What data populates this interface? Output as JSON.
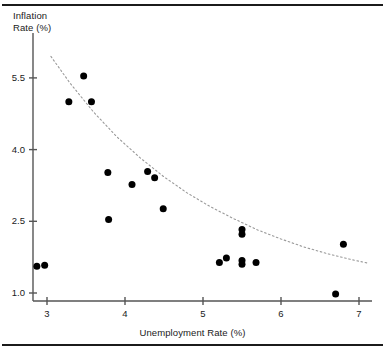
{
  "figure": {
    "ylabel_line1": "Inflation",
    "ylabel_line2": "Rate (%)",
    "xlabel": "Unemployment Rate (%)",
    "rule_color": "#1b1b1b",
    "axis_color": "#555555",
    "point_color": "#000000",
    "trend_color": "#9a9a9a"
  },
  "chart_data": {
    "type": "scatter",
    "title": "",
    "xlabel": "Unemployment Rate (%)",
    "ylabel": "Inflation Rate (%)",
    "xlim": [
      2.62,
      7.3
    ],
    "ylim": [
      0.83,
      6.1
    ],
    "xticks": [
      3,
      4,
      5,
      6,
      7
    ],
    "xtick_labels": [
      "3",
      "4",
      "5",
      "6",
      "7"
    ],
    "yticks": [
      1.0,
      2.5,
      4.0,
      5.5
    ],
    "ytick_labels": [
      "1.0",
      "2.5",
      "4.0",
      "5.5"
    ],
    "grid": false,
    "legend": null,
    "points": [
      {
        "x": 2.87,
        "y": 1.56
      },
      {
        "x": 2.97,
        "y": 1.58
      },
      {
        "x": 3.28,
        "y": 5.0
      },
      {
        "x": 3.47,
        "y": 5.54
      },
      {
        "x": 3.57,
        "y": 5.0
      },
      {
        "x": 3.78,
        "y": 3.52
      },
      {
        "x": 3.79,
        "y": 2.54
      },
      {
        "x": 4.09,
        "y": 3.27
      },
      {
        "x": 4.29,
        "y": 3.54
      },
      {
        "x": 4.38,
        "y": 3.41
      },
      {
        "x": 4.49,
        "y": 2.76
      },
      {
        "x": 5.21,
        "y": 1.64
      },
      {
        "x": 5.3,
        "y": 1.73
      },
      {
        "x": 5.5,
        "y": 2.33
      },
      {
        "x": 5.5,
        "y": 2.23
      },
      {
        "x": 5.5,
        "y": 1.68
      },
      {
        "x": 5.5,
        "y": 1.6
      },
      {
        "x": 5.68,
        "y": 1.64
      },
      {
        "x": 6.8,
        "y": 2.02
      },
      {
        "x": 6.7,
        "y": 0.98
      }
    ],
    "trend_curve": {
      "style": "dotted",
      "description": "decreasing exponential fit",
      "points": [
        {
          "x": 3.05,
          "y": 5.95
        },
        {
          "x": 3.3,
          "y": 5.38
        },
        {
          "x": 3.6,
          "y": 4.78
        },
        {
          "x": 3.9,
          "y": 4.26
        },
        {
          "x": 4.2,
          "y": 3.82
        },
        {
          "x": 4.5,
          "y": 3.43
        },
        {
          "x": 4.8,
          "y": 3.09
        },
        {
          "x": 5.1,
          "y": 2.8
        },
        {
          "x": 5.4,
          "y": 2.55
        },
        {
          "x": 5.7,
          "y": 2.32
        },
        {
          "x": 6.0,
          "y": 2.13
        },
        {
          "x": 6.3,
          "y": 1.96
        },
        {
          "x": 6.6,
          "y": 1.82
        },
        {
          "x": 6.9,
          "y": 1.7
        },
        {
          "x": 7.1,
          "y": 1.63
        }
      ]
    }
  }
}
